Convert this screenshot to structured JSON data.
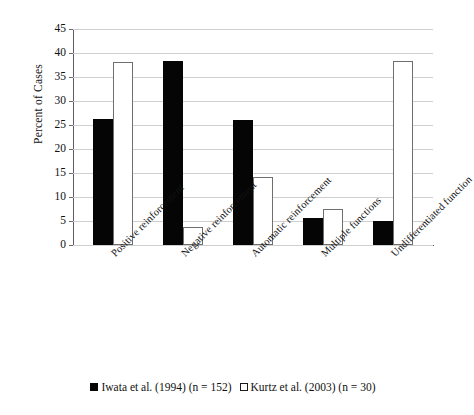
{
  "chart_data": {
    "type": "bar",
    "title": "",
    "xlabel": "",
    "ylabel": "Percent of Cases",
    "ylim": [
      0,
      45
    ],
    "yticks": [
      0,
      5,
      10,
      15,
      20,
      25,
      30,
      35,
      40,
      45
    ],
    "ytick_labels": [
      "0",
      "5",
      "10",
      "15",
      "20",
      "25",
      "30",
      "35",
      "40",
      "45"
    ],
    "grid": true,
    "legend_position": "bottom",
    "categories": [
      "Positive reinforcement",
      "Negative reinforcement",
      "Automatic reinforcement",
      "Multiple functions",
      "Undifferentiated function"
    ],
    "series": [
      {
        "name": "Iwata et al. (1994) (n = 152)",
        "marker": "filled-square",
        "color": "#050505",
        "values": [
          26.3,
          38.3,
          26.0,
          5.6,
          5.0
        ]
      },
      {
        "name": "Kurtz et al. (2003) (n = 30)",
        "marker": "hollow-square",
        "color": "#ffffff",
        "values": [
          38.1,
          3.7,
          14.2,
          7.5,
          38.4
        ]
      }
    ]
  },
  "legend": {
    "entries": [
      {
        "label": "Iwata et al. (1994) (n = 152)"
      },
      {
        "label": "Kurtz et al. (2003) (n = 30)"
      }
    ]
  }
}
